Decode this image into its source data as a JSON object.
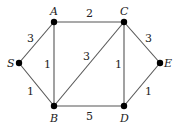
{
  "graph": {
    "nodes": [
      {
        "id": "S",
        "label": "S",
        "x": 19,
        "y": 63,
        "lx": 7,
        "ly": 67
      },
      {
        "id": "A",
        "label": "A",
        "x": 54,
        "y": 22,
        "lx": 50,
        "ly": 15
      },
      {
        "id": "B",
        "label": "B",
        "x": 54,
        "y": 106,
        "lx": 50,
        "ly": 122
      },
      {
        "id": "C",
        "label": "C",
        "x": 124,
        "y": 22,
        "lx": 120,
        "ly": 15
      },
      {
        "id": "D",
        "label": "D",
        "x": 124,
        "y": 106,
        "lx": 120,
        "ly": 122
      },
      {
        "id": "E",
        "label": "E",
        "x": 160,
        "y": 63,
        "lx": 164,
        "ly": 67
      }
    ],
    "edges": [
      {
        "from": "S",
        "to": "A",
        "weight": "3",
        "wx": 27,
        "wy": 42
      },
      {
        "from": "S",
        "to": "B",
        "weight": "1",
        "wx": 27,
        "wy": 95
      },
      {
        "from": "A",
        "to": "C",
        "weight": "2",
        "wx": 86,
        "wy": 17
      },
      {
        "from": "A",
        "to": "B",
        "weight": "1",
        "wx": 44,
        "wy": 68
      },
      {
        "from": "B",
        "to": "C",
        "weight": "3",
        "wx": 83,
        "wy": 60
      },
      {
        "from": "C",
        "to": "D",
        "weight": "1",
        "wx": 115,
        "wy": 68
      },
      {
        "from": "B",
        "to": "D",
        "weight": "5",
        "wx": 86,
        "wy": 120
      },
      {
        "from": "C",
        "to": "E",
        "weight": "3",
        "wx": 145,
        "wy": 42
      },
      {
        "from": "D",
        "to": "E",
        "weight": "1",
        "wx": 145,
        "wy": 95
      }
    ]
  }
}
